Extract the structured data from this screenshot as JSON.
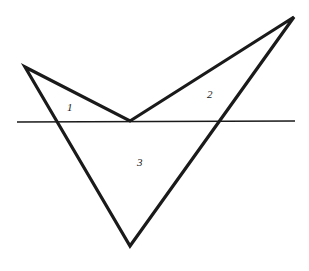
{
  "diagram": {
    "shape": {
      "stroke": "#1a1a1a",
      "vertices": [
        {
          "id": "A",
          "x": 25,
          "y": 67
        },
        {
          "id": "B",
          "x": 130,
          "y": 121
        },
        {
          "id": "C",
          "x": 294,
          "y": 17
        },
        {
          "id": "D",
          "x": 130,
          "y": 246
        }
      ]
    },
    "line": {
      "x1": 17,
      "y1": 122,
      "x2": 295,
      "y2": 121
    },
    "regions": [
      {
        "label": "1",
        "x": 70,
        "y": 111
      },
      {
        "label": "2",
        "x": 210,
        "y": 98
      },
      {
        "label": "3",
        "x": 140,
        "y": 166
      }
    ]
  }
}
